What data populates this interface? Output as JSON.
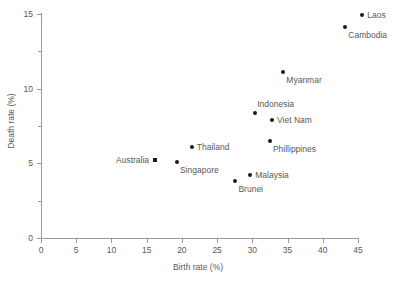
{
  "chart_data": {
    "type": "scatter",
    "title": "",
    "subtitle": "",
    "xlabel": "Birth rate (%)",
    "ylabel": "Death rate (%)",
    "xlim": [
      0,
      45
    ],
    "ylim": [
      0,
      15
    ],
    "xticks": [
      0,
      5,
      10,
      15,
      20,
      25,
      30,
      35,
      40,
      45
    ],
    "yticks": [
      0,
      5,
      10,
      15
    ],
    "y_minor_ticks": [
      2.5,
      7.5,
      12.5
    ],
    "xtick_labels": [
      "0",
      "5",
      "10",
      "15",
      "20",
      "25",
      "30",
      "35",
      "40",
      "45"
    ],
    "ytick_labels": [
      "0",
      "5",
      "10",
      "15"
    ],
    "grid": false,
    "legend": false,
    "marker_color": "#1a1a1a",
    "axis_color": "#9a9a9a",
    "text_color": "#595959",
    "points": [
      {
        "name": "Laos",
        "x": 45.6,
        "y": 14.9,
        "marker": "circle",
        "label_pos": "right"
      },
      {
        "name": "Cambodia",
        "x": 43.2,
        "y": 14.1,
        "marker": "circle",
        "label_pos": "below-right"
      },
      {
        "name": "Myanmar",
        "x": 34.4,
        "y": 11.1,
        "marker": "circle",
        "label_pos": "below-right"
      },
      {
        "name": "Indonesia",
        "x": 30.4,
        "y": 8.4,
        "marker": "circle",
        "label_pos": "above-right"
      },
      {
        "name": "Viet Nam",
        "x": 32.8,
        "y": 7.9,
        "marker": "circle",
        "label_pos": "right"
      },
      {
        "name": "Phillippines",
        "x": 32.5,
        "y": 6.5,
        "marker": "circle",
        "label_pos": "below-right"
      },
      {
        "name": "Thailand",
        "x": 21.4,
        "y": 6.1,
        "marker": "circle",
        "label_pos": "right"
      },
      {
        "name": "Australia",
        "x": 16.2,
        "y": 5.2,
        "marker": "square",
        "label_pos": "left"
      },
      {
        "name": "Singapore",
        "x": 19.3,
        "y": 5.1,
        "marker": "circle",
        "label_pos": "below-right"
      },
      {
        "name": "Malaysia",
        "x": 29.7,
        "y": 4.2,
        "marker": "circle",
        "label_pos": "right"
      },
      {
        "name": "Brunei",
        "x": 27.6,
        "y": 3.8,
        "marker": "circle",
        "label_pos": "below-right"
      }
    ]
  }
}
